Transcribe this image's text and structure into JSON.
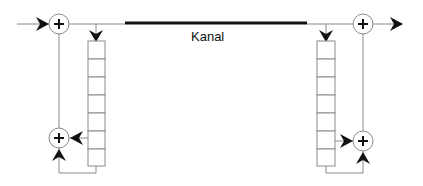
{
  "diagram": {
    "channel_label": "Kanal",
    "colors": {
      "line": "#8a8a8a",
      "channel": "#111111",
      "symbol": "#111111",
      "background": "#ffffff"
    },
    "nodes": [
      {
        "id": "adder-top-left",
        "type": "adder",
        "symbol": "+"
      },
      {
        "id": "adder-bottom-left",
        "type": "adder",
        "symbol": "+"
      },
      {
        "id": "adder-top-right",
        "type": "adder",
        "symbol": "+"
      },
      {
        "id": "adder-bottom-right",
        "type": "adder",
        "symbol": "+"
      },
      {
        "id": "register-left",
        "type": "shift-register",
        "cells": 7
      },
      {
        "id": "register-right",
        "type": "shift-register",
        "cells": 7
      },
      {
        "id": "channel",
        "type": "channel",
        "label": "Kanal"
      }
    ]
  }
}
